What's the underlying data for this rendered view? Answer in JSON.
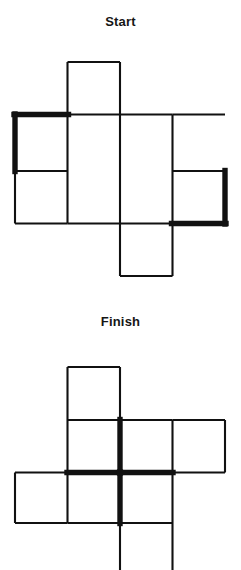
{
  "document": {
    "kind": "matchstick-puzzle",
    "panels": [
      "start",
      "finish"
    ]
  },
  "start": {
    "title": "Start",
    "geometry": {
      "cell": 52.5,
      "columns_x": [
        15,
        67.5,
        120,
        172.5,
        225
      ],
      "rows_y": [
        62,
        114.5,
        171,
        223.5,
        276
      ]
    },
    "cells": [
      {
        "name": "top",
        "col": 2,
        "row": 1
      },
      {
        "name": "left-upper",
        "col": 1,
        "row": 2
      },
      {
        "name": "center-upper",
        "col": 2,
        "row": 2
      },
      {
        "name": "right-upper",
        "col": 4,
        "row": 2
      },
      {
        "name": "left-lower",
        "col": 1,
        "row": 3
      },
      {
        "name": "center-lower",
        "col": 2,
        "row": 3
      },
      {
        "name": "right-lower",
        "col": 4,
        "row": 3
      },
      {
        "name": "bottom",
        "col": 3,
        "row": 4
      }
    ],
    "matches": {
      "normal_count": 20,
      "bold_count": 4,
      "bold": [
        {
          "id": "top-left-horizontal",
          "orientation": "horizontal",
          "x1": 15,
          "x2": 67.5,
          "y": 114.5
        },
        {
          "id": "left-vertical",
          "orientation": "vertical",
          "x": 15,
          "y1": 114.5,
          "y2": 171
        },
        {
          "id": "right-vertical",
          "orientation": "vertical",
          "x": 225,
          "y1": 171,
          "y2": 223.5
        },
        {
          "id": "bottom-right-horizontal",
          "orientation": "horizontal",
          "x1": 172.5,
          "x2": 225,
          "y": 223.5
        }
      ]
    }
  },
  "finish": {
    "title": "Finish",
    "geometry": {
      "cell": 52.5,
      "columns_x": [
        15,
        67.5,
        120,
        172.5,
        225
      ],
      "rows_y": [
        367,
        420,
        472.5,
        523,
        575
      ]
    },
    "cells": [
      {
        "name": "top",
        "col": 2,
        "row": 1
      },
      {
        "name": "mid-left",
        "col": 2,
        "row": 2
      },
      {
        "name": "mid-center",
        "col": 3,
        "row": 2
      },
      {
        "name": "mid-right",
        "col": 4,
        "row": 2
      },
      {
        "name": "low-far-left",
        "col": 1,
        "row": 3
      },
      {
        "name": "low-left",
        "col": 2,
        "row": 3
      },
      {
        "name": "low-center",
        "col": 3,
        "row": 3
      },
      {
        "name": "bottom",
        "col": 3,
        "row": 4
      }
    ],
    "matches": {
      "normal_count": 20,
      "bold_count": 4,
      "bold": [
        {
          "id": "cross-up-vertical",
          "orientation": "vertical",
          "x": 120,
          "y1": 420,
          "y2": 472.5
        },
        {
          "id": "cross-down-vertical",
          "orientation": "vertical",
          "x": 120,
          "y1": 472.5,
          "y2": 523
        },
        {
          "id": "cross-left-horizontal",
          "orientation": "horizontal",
          "x1": 67.5,
          "x2": 120,
          "y": 472.5
        },
        {
          "id": "cross-right-horizontal",
          "orientation": "horizontal",
          "x1": 120,
          "x2": 172.5,
          "y": 472.5
        }
      ]
    }
  },
  "colors": {
    "background": "#ffffff",
    "match": "#111111",
    "title": "#151515"
  }
}
